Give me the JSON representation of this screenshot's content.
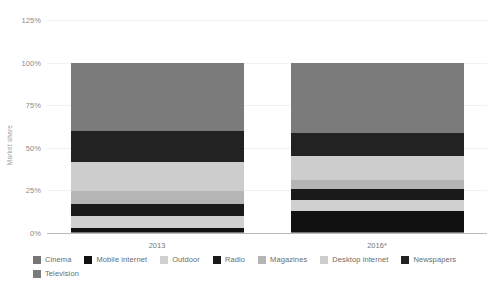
{
  "chart_data": {
    "type": "bar",
    "stacked": true,
    "title": "",
    "xlabel": "",
    "ylabel": "Market share",
    "categories": [
      "2013",
      "2016*"
    ],
    "ylim": [
      0,
      125
    ],
    "yticks": [
      "0%",
      "25%",
      "50%",
      "75%",
      "100%",
      "125%"
    ],
    "ytick_values": [
      0,
      25,
      50,
      75,
      100,
      125
    ],
    "grid": true,
    "legend_position": "bottom",
    "series": [
      {
        "name": "Cinema",
        "color": "#767676",
        "values": [
          0.6,
          0.6
        ]
      },
      {
        "name": "Mobile internet",
        "color": "#111111",
        "values": [
          2.6,
          12.5
        ]
      },
      {
        "name": "Outdoor",
        "color": "#d0d0d0",
        "values": [
          6.7,
          6.5
        ]
      },
      {
        "name": "Radio",
        "color": "#1a1a1a",
        "values": [
          6.9,
          6.1
        ]
      },
      {
        "name": "Magazines",
        "color": "#b5b5b5",
        "values": [
          7.6,
          5.3
        ]
      },
      {
        "name": "Desktop internet",
        "color": "#cdcdcd",
        "values": [
          17.3,
          14.1
        ]
      },
      {
        "name": "Newspapers",
        "color": "#222222",
        "values": [
          18.3,
          13.9
        ]
      },
      {
        "name": "Television",
        "color": "#7b7b7b",
        "values": [
          40.0,
          41.0
        ]
      }
    ]
  },
  "legend": {
    "items": [
      {
        "label": "Cinema"
      },
      {
        "label": "Mobile internet"
      },
      {
        "label": "Outdoor"
      },
      {
        "label": "Radio"
      },
      {
        "label": "Magazines"
      },
      {
        "label": "Desktop internet"
      },
      {
        "label": "Newspapers"
      },
      {
        "label": "Television"
      }
    ]
  }
}
